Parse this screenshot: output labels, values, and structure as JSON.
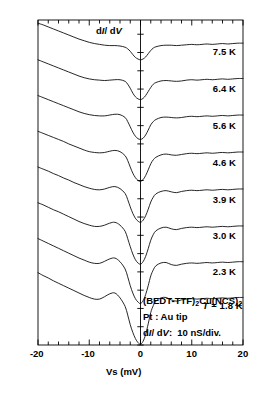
{
  "figure": {
    "ylabel_inplot": "d I / d V",
    "xaxis_label": "Vs  (mV)",
    "xticks": [
      "-20",
      "-10",
      "0",
      "10",
      "20"
    ],
    "xlim": [
      -20,
      20
    ],
    "annotations": {
      "sample": "(BEDT-TTF)2Cu(NCS)2",
      "tip": "Pt : Au  tip",
      "scale": "d I / d V :  10 nS/div."
    }
  },
  "chart_data": {
    "type": "line",
    "title": "",
    "subtitle": "",
    "xlabel": "Vs (mV)",
    "ylabel": "dI/dV",
    "xlim": [
      -20,
      20
    ],
    "ylim": [
      0,
      8
    ],
    "grid": false,
    "legend_position": "right-inline",
    "xticks_major": [
      -20,
      -10,
      0,
      10,
      20
    ],
    "xticks_minor_step": 2,
    "yaxis_note": "vertical axis at Vs = 0 with tick divisions; 10 nS per division; curves offset vertically",
    "annotations": [
      {
        "text": "dI/dV",
        "x": -6.0,
        "y": 7.55
      },
      {
        "text": "(BEDT-TTF)2Cu(NCS)2",
        "x": 1.0,
        "y": 0.95
      },
      {
        "text": "Pt : Au tip",
        "x": 1.0,
        "y": 0.6
      },
      {
        "text": "dI/dV : 10 nS/div.",
        "x": 1.0,
        "y": 0.28
      }
    ],
    "series": [
      {
        "name": "7.5 K",
        "label": "7.5 K",
        "label_x": 14.5,
        "label_y": 7.22,
        "offset": 7.35,
        "gap_depth": 0.3,
        "gap_width": 4.6,
        "peak_height": 0.02,
        "x": [
          -20,
          -19,
          -18,
          -17,
          -16,
          -15,
          -14,
          -13,
          -12,
          -11,
          -10,
          -9,
          -8,
          -7,
          -6,
          -5,
          -4,
          -3,
          -2.5,
          -2,
          -1.5,
          -1,
          -0.5,
          0,
          0.5,
          1,
          1.5,
          2,
          2.5,
          3,
          4,
          5,
          6,
          7,
          8,
          9,
          10,
          11,
          12,
          13,
          14,
          15,
          16,
          17,
          18,
          19,
          20
        ],
        "y": [
          7.92,
          7.88,
          7.83,
          7.78,
          7.73,
          7.68,
          7.63,
          7.58,
          7.53,
          7.49,
          7.45,
          7.42,
          7.4,
          7.38,
          7.37,
          7.37,
          7.36,
          7.33,
          7.29,
          7.23,
          7.15,
          7.08,
          7.04,
          7.02,
          7.04,
          7.09,
          7.17,
          7.25,
          7.31,
          7.34,
          7.37,
          7.38,
          7.38,
          7.37,
          7.38,
          7.39,
          7.4,
          7.39,
          7.4,
          7.41,
          7.4,
          7.41,
          7.42,
          7.41,
          7.42,
          7.43,
          7.43
        ]
      },
      {
        "name": "6.4 K",
        "label": "6.4 K",
        "label_x": 14.5,
        "label_y": 6.3,
        "offset": 6.45,
        "gap_depth": 0.4,
        "gap_width": 4.8,
        "peak_height": 0.04,
        "x": [
          -20,
          -19,
          -18,
          -17,
          -16,
          -15,
          -14,
          -13,
          -12,
          -11,
          -10,
          -9,
          -8,
          -7,
          -6,
          -5,
          -4,
          -3,
          -2.5,
          -2,
          -1.5,
          -1,
          -0.5,
          0,
          0.5,
          1,
          1.5,
          2,
          2.5,
          3,
          4,
          5,
          6,
          7,
          8,
          9,
          10,
          11,
          12,
          13,
          14,
          15,
          16,
          17,
          18,
          19,
          20
        ],
        "y": [
          7.02,
          6.97,
          6.92,
          6.87,
          6.82,
          6.77,
          6.72,
          6.67,
          6.62,
          6.58,
          6.55,
          6.53,
          6.52,
          6.51,
          6.52,
          6.53,
          6.53,
          6.49,
          6.42,
          6.32,
          6.2,
          6.11,
          6.06,
          6.04,
          6.07,
          6.14,
          6.24,
          6.34,
          6.42,
          6.46,
          6.5,
          6.51,
          6.5,
          6.49,
          6.5,
          6.52,
          6.53,
          6.52,
          6.53,
          6.54,
          6.53,
          6.54,
          6.55,
          6.54,
          6.55,
          6.56,
          6.56
        ]
      },
      {
        "name": "5.6 K",
        "label": "5.6 K",
        "label_x": 14.5,
        "label_y": 5.4,
        "offset": 5.55,
        "gap_depth": 0.5,
        "gap_width": 5.0,
        "peak_height": 0.06,
        "x": [
          -20,
          -19,
          -18,
          -17,
          -16,
          -15,
          -14,
          -13,
          -12,
          -11,
          -10,
          -9,
          -8,
          -7,
          -6,
          -5,
          -4,
          -3,
          -2.5,
          -2,
          -1.5,
          -1,
          -0.5,
          0,
          0.5,
          1,
          1.5,
          2,
          2.5,
          3,
          4,
          5,
          6,
          7,
          8,
          9,
          10,
          11,
          12,
          13,
          14,
          15,
          16,
          17,
          18,
          19,
          20
        ],
        "y": [
          6.14,
          6.09,
          6.04,
          5.99,
          5.94,
          5.89,
          5.84,
          5.79,
          5.74,
          5.7,
          5.67,
          5.65,
          5.64,
          5.64,
          5.66,
          5.68,
          5.67,
          5.6,
          5.5,
          5.37,
          5.24,
          5.14,
          5.08,
          5.06,
          5.09,
          5.17,
          5.29,
          5.42,
          5.5,
          5.55,
          5.6,
          5.61,
          5.6,
          5.59,
          5.6,
          5.62,
          5.63,
          5.62,
          5.63,
          5.64,
          5.63,
          5.64,
          5.65,
          5.64,
          5.65,
          5.66,
          5.66
        ]
      },
      {
        "name": "4.6 K",
        "label": "4.6 K",
        "label_x": 14.5,
        "label_y": 4.48,
        "offset": 4.62,
        "gap_depth": 0.62,
        "gap_width": 5.2,
        "peak_height": 0.09,
        "x": [
          -20,
          -19,
          -18,
          -17,
          -16,
          -15,
          -14,
          -13,
          -12,
          -11,
          -10,
          -9,
          -8,
          -7,
          -6,
          -5,
          -4,
          -3,
          -2.5,
          -2,
          -1.5,
          -1,
          -0.5,
          0,
          0.5,
          1,
          1.5,
          2,
          2.5,
          3,
          4,
          5,
          6,
          7,
          8,
          9,
          10,
          11,
          12,
          13,
          14,
          15,
          16,
          17,
          18,
          19,
          20
        ],
        "y": [
          5.26,
          5.21,
          5.16,
          5.11,
          5.06,
          5.01,
          4.95,
          4.9,
          4.85,
          4.8,
          4.76,
          4.74,
          4.73,
          4.74,
          4.77,
          4.79,
          4.76,
          4.66,
          4.54,
          4.38,
          4.23,
          4.12,
          4.05,
          4.03,
          4.07,
          4.17,
          4.31,
          4.46,
          4.56,
          4.62,
          4.68,
          4.7,
          4.68,
          4.67,
          4.69,
          4.71,
          4.72,
          4.71,
          4.72,
          4.73,
          4.72,
          4.73,
          4.74,
          4.73,
          4.74,
          4.75,
          4.75
        ]
      },
      {
        "name": "3.9 K",
        "label": "3.9 K",
        "label_x": 14.5,
        "label_y": 3.56,
        "offset": 3.7,
        "gap_depth": 0.74,
        "gap_width": 5.4,
        "peak_height": 0.12,
        "x": [
          -20,
          -19,
          -18,
          -17,
          -16,
          -15,
          -14,
          -13,
          -12,
          -11,
          -10,
          -9,
          -8,
          -7,
          -6,
          -5,
          -4,
          -3,
          -2.5,
          -2,
          -1.5,
          -1,
          -0.5,
          0,
          0.5,
          1,
          1.5,
          2,
          2.5,
          3,
          4,
          5,
          6,
          7,
          8,
          9,
          10,
          11,
          12,
          13,
          14,
          15,
          16,
          17,
          18,
          19,
          20
        ],
        "y": [
          4.38,
          4.33,
          4.28,
          4.22,
          4.17,
          4.11,
          4.06,
          4.0,
          3.95,
          3.9,
          3.86,
          3.83,
          3.82,
          3.84,
          3.88,
          3.9,
          3.85,
          3.73,
          3.58,
          3.4,
          3.24,
          3.12,
          3.05,
          3.02,
          3.07,
          3.18,
          3.34,
          3.52,
          3.64,
          3.72,
          3.78,
          3.8,
          3.77,
          3.75,
          3.78,
          3.8,
          3.81,
          3.8,
          3.81,
          3.82,
          3.81,
          3.82,
          3.83,
          3.82,
          3.83,
          3.84,
          3.84
        ]
      },
      {
        "name": "3.0 K",
        "label": "3.0 K",
        "label_x": 14.5,
        "label_y": 2.68,
        "offset": 2.8,
        "gap_depth": 0.88,
        "gap_width": 5.6,
        "peak_height": 0.16,
        "x": [
          -20,
          -19,
          -18,
          -17,
          -16,
          -15,
          -14,
          -13,
          -12,
          -11,
          -10,
          -9,
          -8,
          -7,
          -6,
          -5,
          -4,
          -3,
          -2.5,
          -2,
          -1.5,
          -1,
          -0.5,
          0,
          0.5,
          1,
          1.5,
          2,
          2.5,
          3,
          4,
          5,
          6,
          7,
          8,
          9,
          10,
          11,
          12,
          13,
          14,
          15,
          16,
          17,
          18,
          19,
          20
        ],
        "y": [
          3.5,
          3.45,
          3.39,
          3.33,
          3.28,
          3.22,
          3.16,
          3.1,
          3.04,
          2.99,
          2.95,
          2.92,
          2.92,
          2.95,
          3.0,
          3.02,
          2.95,
          2.8,
          2.62,
          2.42,
          2.24,
          2.1,
          2.02,
          1.99,
          2.05,
          2.18,
          2.37,
          2.58,
          2.72,
          2.81,
          2.88,
          2.9,
          2.86,
          2.84,
          2.87,
          2.89,
          2.9,
          2.89,
          2.9,
          2.91,
          2.9,
          2.91,
          2.92,
          2.91,
          2.92,
          2.93,
          2.93
        ]
      },
      {
        "name": "2.3 K",
        "label": "2.3 K",
        "label_x": 14.5,
        "label_y": 1.8,
        "offset": 1.9,
        "gap_depth": 1.0,
        "gap_width": 5.8,
        "peak_height": 0.2,
        "x": [
          -20,
          -19,
          -18,
          -17,
          -16,
          -15,
          -14,
          -13,
          -12,
          -11,
          -10,
          -9,
          -8,
          -7,
          -6,
          -5,
          -4,
          -3,
          -2.5,
          -2,
          -1.5,
          -1,
          -0.5,
          0,
          0.5,
          1,
          1.5,
          2,
          2.5,
          3,
          4,
          5,
          6,
          7,
          8,
          9,
          10,
          11,
          12,
          13,
          14,
          15,
          16,
          17,
          18,
          19,
          20
        ],
        "y": [
          2.62,
          2.56,
          2.5,
          2.44,
          2.38,
          2.32,
          2.26,
          2.2,
          2.14,
          2.09,
          2.04,
          2.01,
          2.01,
          2.06,
          2.12,
          2.14,
          2.05,
          1.87,
          1.68,
          1.46,
          1.28,
          1.14,
          1.06,
          1.02,
          1.09,
          1.24,
          1.46,
          1.7,
          1.85,
          1.95,
          2.02,
          2.03,
          1.98,
          1.96,
          1.99,
          2.01,
          2.02,
          2.01,
          2.02,
          2.03,
          2.02,
          2.03,
          2.04,
          2.03,
          2.04,
          2.05,
          2.05
        ]
      },
      {
        "name": "1.8 K",
        "label": "T = 1.8 K",
        "label_x": 12.5,
        "label_y": 0.95,
        "offset": 1.0,
        "gap_depth": 1.12,
        "gap_width": 6.0,
        "peak_height": 0.24,
        "x": [
          -20,
          -19,
          -18,
          -17,
          -16,
          -15,
          -14,
          -13,
          -12,
          -11,
          -10,
          -9,
          -8,
          -7,
          -6,
          -5,
          -4,
          -3,
          -2.5,
          -2,
          -1.5,
          -1,
          -0.5,
          0,
          0.5,
          1,
          1.5,
          2,
          2.5,
          3,
          4,
          5,
          6,
          7,
          8,
          9,
          10,
          11,
          12,
          13,
          14,
          15,
          16,
          17,
          18,
          19,
          20
        ],
        "y": [
          1.78,
          1.71,
          1.65,
          1.58,
          1.52,
          1.46,
          1.4,
          1.34,
          1.28,
          1.22,
          1.17,
          1.13,
          1.13,
          1.19,
          1.26,
          1.28,
          1.16,
          0.95,
          0.74,
          0.5,
          0.31,
          0.16,
          0.06,
          0.02,
          0.09,
          0.26,
          0.52,
          0.8,
          0.97,
          1.08,
          1.16,
          1.17,
          1.11,
          1.08,
          1.11,
          1.13,
          1.14,
          1.13,
          1.14,
          1.15,
          1.14,
          1.15,
          1.16,
          1.15,
          1.16,
          1.17,
          1.17
        ]
      }
    ]
  }
}
